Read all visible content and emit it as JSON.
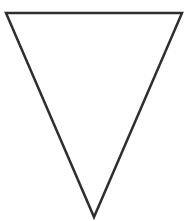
{
  "canvas": {
    "width": 194,
    "height": 221,
    "background": "#ffffff"
  },
  "shape": {
    "type": "inverted-triangle",
    "points": "6,13 182,13 94,217",
    "stroke": "#2e2e2e",
    "stroke_width": "2.5",
    "fill": "#ffffff"
  }
}
